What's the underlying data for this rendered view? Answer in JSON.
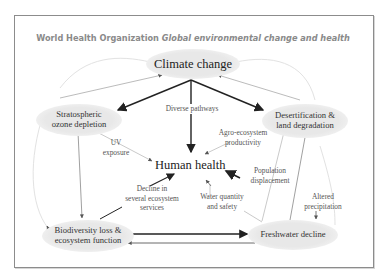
{
  "header": {
    "org": "World Health Organization",
    "subtitle": "Global environmental change and health"
  },
  "nodes": {
    "climate": "Climate change",
    "ozone": "Stratospheric\nozone depletion",
    "desert": "Desertification &\nland degradation",
    "human": "Human health",
    "biodiversity": "Biodiversity loss &\necosystem function",
    "freshwater": "Freshwater decline"
  },
  "edge_labels": {
    "diverse": "Diverse pathways",
    "uv": "UV\nexposure",
    "agro": "Agro-ecosystem\nproductivity",
    "population": "Population\ndisplacement",
    "ecosystem": "Decline in\nseveral ecosystem\nservices",
    "water": "Water quantity\nand safety",
    "precip": "Altered\nprecipitation"
  },
  "colors": {
    "node_fill": "#e8e8e8",
    "strong_arrow": "#222222",
    "weak_arrow": "#9a9a9a",
    "faint_arrow": "#dcdcdc",
    "frame": "#8c8c8c"
  }
}
